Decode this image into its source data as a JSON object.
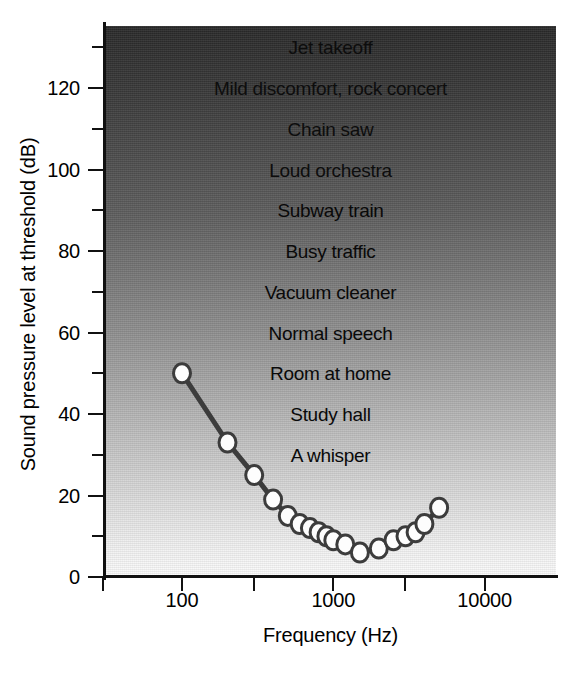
{
  "chart_data": {
    "type": "line",
    "title": "",
    "xlabel": "Frequency (Hz)",
    "ylabel": "Sound pressure level at threshold (dB)",
    "xscale": "log",
    "xlim": [
      48,
      27000
    ],
    "ylim": [
      0,
      133
    ],
    "grid": false,
    "legend": null,
    "x_ticks": [
      {
        "value": 30,
        "label": ""
      },
      {
        "value": 100,
        "label": "100"
      },
      {
        "value": 300,
        "label": ""
      },
      {
        "value": 1000,
        "label": "1000"
      },
      {
        "value": 3000,
        "label": ""
      },
      {
        "value": 10000,
        "label": "10000"
      }
    ],
    "y_ticks": [
      {
        "value": 0,
        "label": "0"
      },
      {
        "value": 10,
        "label": ""
      },
      {
        "value": 20,
        "label": "20"
      },
      {
        "value": 30,
        "label": ""
      },
      {
        "value": 40,
        "label": "40"
      },
      {
        "value": 50,
        "label": ""
      },
      {
        "value": 60,
        "label": "60"
      },
      {
        "value": 70,
        "label": ""
      },
      {
        "value": 80,
        "label": "80"
      },
      {
        "value": 90,
        "label": ""
      },
      {
        "value": 100,
        "label": "100"
      },
      {
        "value": 110,
        "label": ""
      },
      {
        "value": 120,
        "label": "120"
      },
      {
        "value": 130,
        "label": ""
      }
    ],
    "series": [
      {
        "name": "Absolute threshold of hearing",
        "marker": "open-circle",
        "x": [
          100,
          200,
          300,
          400,
          500,
          600,
          700,
          800,
          900,
          1000,
          1200,
          1500,
          2000,
          2500,
          3000,
          3500,
          4000,
          5000
        ],
        "y": [
          50,
          33,
          25,
          19,
          15,
          13,
          12,
          11,
          10,
          9,
          8,
          6,
          7,
          9,
          10,
          11,
          13,
          17
        ]
      }
    ],
    "annotations": [
      {
        "text": "Jet takeoff",
        "db": 130
      },
      {
        "text": "Mild discomfort, rock concert",
        "db": 120
      },
      {
        "text": "Chain saw",
        "db": 110
      },
      {
        "text": "Loud orchestra",
        "db": 100
      },
      {
        "text": "Subway train",
        "db": 90
      },
      {
        "text": "Busy traffic",
        "db": 80
      },
      {
        "text": "Vacuum cleaner",
        "db": 70
      },
      {
        "text": "Normal speech",
        "db": 60
      },
      {
        "text": "Room at home",
        "db": 50
      },
      {
        "text": "Study hall",
        "db": 40
      },
      {
        "text": "A whisper",
        "db": 30
      }
    ],
    "colors": {
      "curve": "#3c3c3c",
      "marker_fill": "#fdfdfd",
      "axis": "#111111",
      "background_top": "#2a2a2a",
      "background_bottom": "#ffffff"
    }
  }
}
